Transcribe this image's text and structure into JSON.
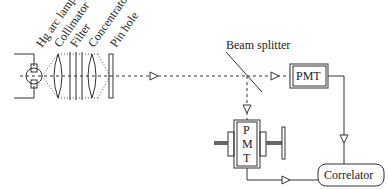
{
  "diagram": {
    "labels": {
      "lamp": "Hg arc lamp",
      "collimator": "Collimator",
      "filter": "Filter",
      "concentrator": "Concentrator",
      "pinhole": "Pin hole",
      "beam_splitter": "Beam splitter",
      "pmt_top": "PMT",
      "pmt_bottom_p": "P",
      "pmt_bottom_m": "M",
      "pmt_bottom_t": "T",
      "correlator": "Correlator"
    },
    "components": [
      {
        "id": "lamp",
        "name": "Hg arc lamp"
      },
      {
        "id": "collimator",
        "name": "Collimator"
      },
      {
        "id": "filter",
        "name": "Filter"
      },
      {
        "id": "concentrator",
        "name": "Concentrator"
      },
      {
        "id": "pinhole",
        "name": "Pin hole"
      },
      {
        "id": "beam_splitter",
        "name": "Beam splitter"
      },
      {
        "id": "pmt_1",
        "name": "PMT"
      },
      {
        "id": "pmt_2",
        "name": "PMT (movable on screw stage)"
      },
      {
        "id": "correlator",
        "name": "Correlator"
      }
    ],
    "connections": [
      {
        "from": "pinhole",
        "to": "beam_splitter",
        "kind": "light path"
      },
      {
        "from": "beam_splitter",
        "to": "pmt_1",
        "kind": "light path"
      },
      {
        "from": "beam_splitter",
        "to": "pmt_2",
        "kind": "light path"
      },
      {
        "from": "pmt_1",
        "to": "correlator",
        "kind": "signal"
      },
      {
        "from": "pmt_2",
        "to": "correlator",
        "kind": "signal"
      }
    ]
  }
}
